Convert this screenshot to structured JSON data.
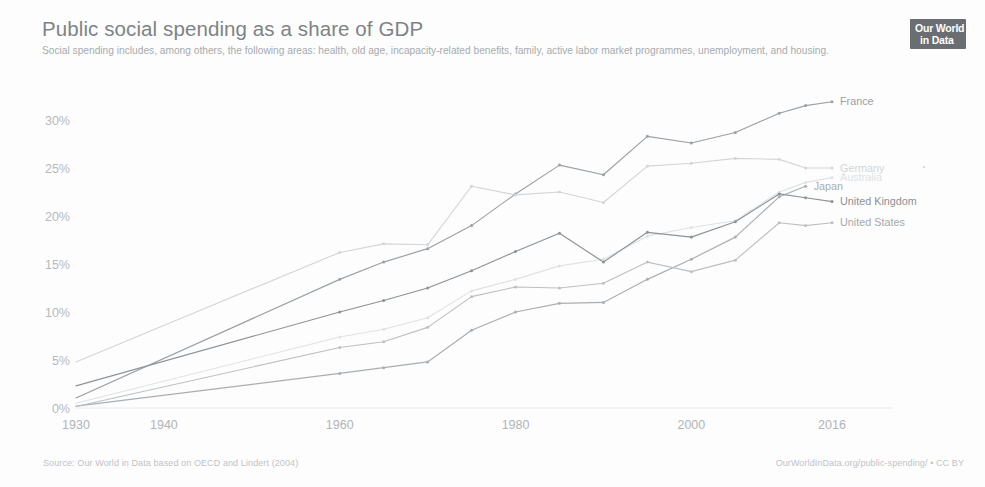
{
  "header": {
    "title": "Public social spending as a share of GDP",
    "subtitle": "Social spending includes, among others, the following areas: health, old age, incapacity-related benefits, family, active labor market programmes, unemployment, and housing."
  },
  "logo": {
    "line1": "Our World",
    "line2": "in Data",
    "name": "our-world-in-data-logo"
  },
  "footer": {
    "source": "Source: Our World in Data based on OECD and Lindert (2004)",
    "license": "OurWorldInData.org/public-spending/ • CC BY"
  },
  "chart_data": {
    "type": "line",
    "title": "Public social spending as a share of GDP",
    "subtitle": "Social spending includes, among others, the following areas: health, old age, incapacity-related benefits, family, active labor market programmes, unemployment, and housing.",
    "xlabel": "",
    "ylabel": "",
    "xlim": [
      1930,
      2016
    ],
    "ylim": [
      0,
      32
    ],
    "grid": false,
    "legend_position": "right-inline-labels",
    "x_ticks": [
      1930,
      1940,
      1960,
      1980,
      2000,
      2016
    ],
    "x_tick_labels": [
      "1930",
      "1940",
      "1960",
      "1980",
      "2000",
      "2016"
    ],
    "y_ticks": [
      0,
      5,
      10,
      15,
      20,
      25,
      30
    ],
    "y_tick_labels": [
      "0%",
      "5%",
      "10%",
      "15%",
      "20%",
      "25%",
      "30%"
    ],
    "series": [
      {
        "name": "Australia",
        "color": "#dfe2e4",
        "label_color": "#dfe2e4",
        "x": [
          1930,
          1960,
          1965,
          1970,
          1975,
          1980,
          1985,
          1990,
          1995,
          2000,
          2005,
          2010,
          2013,
          2016
        ],
        "values": [
          0.5,
          7.4,
          8.2,
          9.4,
          12.2,
          13.4,
          14.8,
          15.5,
          17.9,
          18.8,
          19.5,
          22.5,
          23.5,
          24.0
        ]
      },
      {
        "name": "France",
        "color": "#9aa0a5",
        "label_color": "#9aa0a5",
        "x": [
          1930,
          1960,
          1965,
          1970,
          1975,
          1980,
          1985,
          1990,
          1995,
          2000,
          2005,
          2010,
          2013,
          2016
        ],
        "values": [
          1.05,
          13.4,
          15.2,
          16.6,
          19.0,
          22.3,
          25.3,
          24.3,
          28.3,
          27.6,
          28.7,
          30.7,
          31.5,
          31.9
        ]
      },
      {
        "name": "Germany",
        "color": "#d2d6d9",
        "label_color": "#d2d6d9",
        "x": [
          1930,
          1960,
          1965,
          1970,
          1975,
          1980,
          1985,
          1990,
          1995,
          2000,
          2005,
          2010,
          2013,
          2016
        ],
        "values": [
          4.8,
          16.2,
          17.1,
          17.0,
          23.1,
          22.2,
          22.5,
          21.4,
          25.2,
          25.5,
          26.0,
          25.9,
          25.0,
          25.0
        ]
      },
      {
        "name": "Japan",
        "color": "#a9aeb2",
        "label_color": "#a9aeb2",
        "x": [
          1930,
          1960,
          1965,
          1970,
          1975,
          1980,
          1985,
          1990,
          1995,
          2000,
          2005,
          2010,
          2013
        ],
        "values": [
          0.2,
          3.6,
          4.2,
          4.8,
          8.1,
          10.0,
          10.9,
          11.0,
          13.4,
          15.5,
          17.8,
          22.0,
          23.1
        ]
      },
      {
        "name": "United Kingdom",
        "color": "#8c9297",
        "label_color": "#8c9297",
        "x": [
          1930,
          1960,
          1965,
          1970,
          1975,
          1980,
          1985,
          1990,
          1995,
          2000,
          2005,
          2010,
          2013,
          2016
        ],
        "values": [
          2.3,
          10.0,
          11.2,
          12.5,
          14.3,
          16.3,
          18.2,
          15.2,
          18.3,
          17.8,
          19.4,
          22.3,
          21.9,
          21.5
        ]
      },
      {
        "name": "United States",
        "color": "#bcc0c3",
        "label_color": "#a4a9ad",
        "x": [
          1930,
          1960,
          1965,
          1970,
          1975,
          1980,
          1985,
          1990,
          1995,
          2000,
          2005,
          2010,
          2013,
          2016
        ],
        "values": [
          0.15,
          6.3,
          6.9,
          8.4,
          11.6,
          12.6,
          12.5,
          13.0,
          15.2,
          14.2,
          15.4,
          19.3,
          19.0,
          19.3
        ]
      }
    ]
  }
}
